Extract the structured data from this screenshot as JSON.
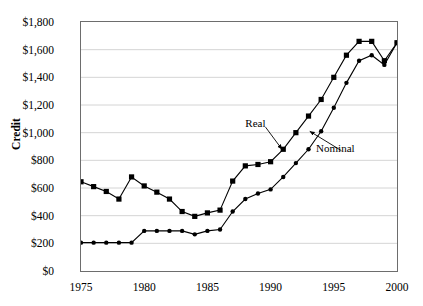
{
  "chart_data": {
    "type": "line",
    "title": "",
    "xlabel": "",
    "ylabel": "Credit",
    "xlim": [
      1975,
      2000
    ],
    "ylim": [
      0,
      1800
    ],
    "ytick_step": 200,
    "grid": true,
    "legend_position": "inline-annotations",
    "currency_prefix": "$",
    "x": [
      1975,
      1976,
      1977,
      1978,
      1979,
      1980,
      1981,
      1982,
      1983,
      1984,
      1985,
      1986,
      1987,
      1988,
      1989,
      1990,
      1991,
      1992,
      1993,
      1994,
      1995,
      1996,
      1997,
      1998,
      1999,
      2000
    ],
    "ytick_labels": [
      "$0",
      "$200",
      "$400",
      "$600",
      "$800",
      "$1,000",
      "$1,200",
      "$1,400",
      "$1,600",
      "$1,800"
    ],
    "ytick_values": [
      0,
      200,
      400,
      600,
      800,
      1000,
      1200,
      1400,
      1600,
      1800
    ],
    "xtick_labels": [
      "1975",
      "1980",
      "1985",
      "1990",
      "1995",
      "2000"
    ],
    "xtick_values": [
      1975,
      1980,
      1985,
      1990,
      1995,
      2000
    ],
    "series": [
      {
        "name": "Real",
        "marker": "square",
        "color": "#000000",
        "values": [
          645,
          610,
          575,
          520,
          680,
          615,
          570,
          520,
          430,
          395,
          420,
          440,
          650,
          760,
          770,
          790,
          880,
          1000,
          1120,
          1240,
          1400,
          1560,
          1660,
          1660,
          1520,
          1650
        ]
      },
      {
        "name": "Nominal",
        "marker": "circle",
        "color": "#000000",
        "values": [
          205,
          205,
          205,
          205,
          205,
          290,
          290,
          290,
          290,
          265,
          290,
          300,
          430,
          520,
          560,
          590,
          680,
          780,
          880,
          1010,
          1180,
          1360,
          1520,
          1560,
          1490,
          1650
        ]
      }
    ],
    "annotations": [
      {
        "label": "Real",
        "x": 1988.0,
        "y": 1060
      },
      {
        "label": "Nominal",
        "x": 1993.6,
        "y": 885
      }
    ]
  }
}
